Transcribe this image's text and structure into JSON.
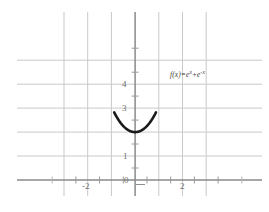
{
  "chart_data": {
    "type": "line",
    "title": "",
    "subtitle": "",
    "xlabel": "",
    "ylabel": "",
    "xlim": [
      -3.5,
      3.5
    ],
    "ylim": [
      -0.7,
      5.4
    ],
    "grid": true,
    "legend_position": "none",
    "x_ticks": [
      -3,
      -2,
      -1,
      0,
      1,
      2,
      3
    ],
    "x_tick_labels": [
      "",
      "-2",
      "",
      "0",
      "",
      "2",
      ""
    ],
    "y_ticks": [
      0,
      1,
      2,
      3,
      4,
      5
    ],
    "y_tick_labels": [
      "0",
      "1",
      "2",
      "3",
      "4",
      ""
    ],
    "minor_x_ticks": [
      -2.5,
      -1.5,
      -0.5,
      0.5,
      1.5,
      2.5
    ],
    "minor_y_ticks": [
      0.5,
      1.5,
      2.5,
      3.5,
      4.5
    ],
    "annotations": [
      {
        "name": "function-equation",
        "text": "f(x)=e^x+e^-x",
        "x": 1.45,
        "y": 4.25
      }
    ],
    "series": [
      {
        "name": "f(x)=e^x+e^-x",
        "formula": "e^x + e^-x",
        "color": "#1a1a1a",
        "line_width": 2.6,
        "x_range": [
          -0.8814,
          0.8814
        ],
        "minimum": {
          "x": 0,
          "y": 2
        },
        "endpoints": [
          {
            "x": -0.8814,
            "y": 4
          },
          {
            "x": 0.8814,
            "y": 4
          }
        ],
        "x": [
          -0.8814,
          -0.8,
          -0.7,
          -0.6,
          -0.5,
          -0.4,
          -0.3,
          -0.2,
          -0.1,
          0,
          0.1,
          0.2,
          0.3,
          0.4,
          0.5,
          0.6,
          0.7,
          0.8,
          0.8814
        ],
        "values": [
          4.0,
          3.6895,
          3.5079,
          3.3731,
          3.2779,
          3.2174,
          3.1887,
          3.0401,
          3.01,
          2.0,
          3.01,
          3.0401,
          3.1887,
          3.2174,
          3.2779,
          3.3731,
          3.5079,
          3.6895,
          4.0
        ]
      }
    ]
  },
  "axes": {
    "x_axis_name": "x-axis",
    "y_axis_name": "y-axis",
    "axis_color": "#8a8a8a",
    "grid_color": "#c9c9c9"
  },
  "labels": {
    "y_4": "4",
    "y_3": "3",
    "y_1": "1",
    "y_0": "0",
    "x_neg2": "-2",
    "x_2": "2",
    "equation_f": "f",
    "equation_paren_open": "(",
    "equation_x": "x",
    "equation_paren_close": ")=",
    "equation_e1": "e",
    "equation_sup1": "x",
    "equation_plus": "+",
    "equation_e2": "e",
    "equation_sup2": "-x"
  }
}
